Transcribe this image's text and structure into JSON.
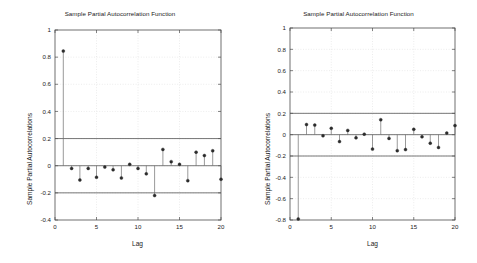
{
  "figure": {
    "background_color": "#ffffff",
    "axis_color": "#4d4d4d",
    "grid_color": "#d9d9d9",
    "stem_color": "#6e6e6e",
    "marker_color": "#2b2b2b",
    "bound_color": "#555555"
  },
  "charts": [
    {
      "id": "left",
      "title": "Sample Partial Autocorrelation Function",
      "xlabel": "Lag",
      "ylabel": "Sample Partial Autocorrelations",
      "xlim": [
        0,
        20
      ],
      "ylim": [
        -0.4,
        1.0
      ],
      "xticks": [
        0,
        5,
        10,
        15,
        20
      ],
      "xticklabels": [
        "0",
        "5",
        "10",
        "15",
        "20"
      ],
      "yticks": [
        -0.4,
        -0.2,
        0,
        0.2,
        0.4,
        0.6,
        0.8,
        1
      ],
      "yticklabels": [
        "-0.4",
        "-0.2",
        "0",
        "0.2",
        "0.4",
        "0.6",
        "0.8",
        "1"
      ],
      "grid": true,
      "confidence_bounds": [
        0.2,
        -0.2
      ],
      "chart_data": {
        "type": "bar",
        "title": "Sample Partial Autocorrelation Function",
        "xlabel": "Lag",
        "ylabel": "Sample Partial Autocorrelations",
        "ylim": [
          -0.4,
          1.0
        ],
        "categories": [
          1,
          2,
          3,
          4,
          5,
          6,
          7,
          8,
          9,
          10,
          11,
          12,
          13,
          14,
          15,
          16,
          17,
          18,
          19,
          20
        ],
        "values": [
          0.845,
          -0.02,
          -0.105,
          -0.02,
          -0.085,
          -0.01,
          -0.03,
          -0.09,
          0.01,
          -0.02,
          -0.06,
          -0.22,
          0.12,
          0.03,
          0.01,
          -0.11,
          0.1,
          0.075,
          0.11,
          -0.1
        ]
      }
    },
    {
      "id": "right",
      "title": "Sample Partial Autocorrelation Function",
      "xlabel": "Lag",
      "ylabel": "Sample Partial Autocorrelations",
      "xlim": [
        0,
        20
      ],
      "ylim": [
        -0.8,
        1.0
      ],
      "xticks": [
        0,
        5,
        10,
        15,
        20
      ],
      "xticklabels": [
        "0",
        "5",
        "10",
        "15",
        "20"
      ],
      "yticks": [
        -0.8,
        -0.6,
        -0.4,
        -0.2,
        0,
        0.2,
        0.4,
        0.6,
        0.8,
        1
      ],
      "yticklabels": [
        "-0.8",
        "-0.6",
        "-0.4",
        "-0.2",
        "0",
        "0.2",
        "0.4",
        "0.6",
        "0.8",
        "1"
      ],
      "grid": true,
      "confidence_bounds": [
        0.2,
        -0.2
      ],
      "chart_data": {
        "type": "bar",
        "title": "Sample Partial Autocorrelation Function",
        "xlabel": "Lag",
        "ylabel": "Sample Partial Autocorrelations",
        "ylim": [
          -0.8,
          1.0
        ],
        "categories": [
          1,
          2,
          3,
          4,
          5,
          6,
          7,
          8,
          9,
          10,
          11,
          12,
          13,
          14,
          15,
          16,
          17,
          18,
          19,
          20
        ],
        "values": [
          -0.79,
          0.095,
          0.09,
          -0.01,
          0.06,
          -0.065,
          0.04,
          -0.03,
          0.005,
          -0.135,
          0.14,
          -0.035,
          -0.15,
          -0.14,
          0.05,
          -0.02,
          -0.08,
          -0.12,
          0.015,
          0.085
        ]
      }
    }
  ]
}
